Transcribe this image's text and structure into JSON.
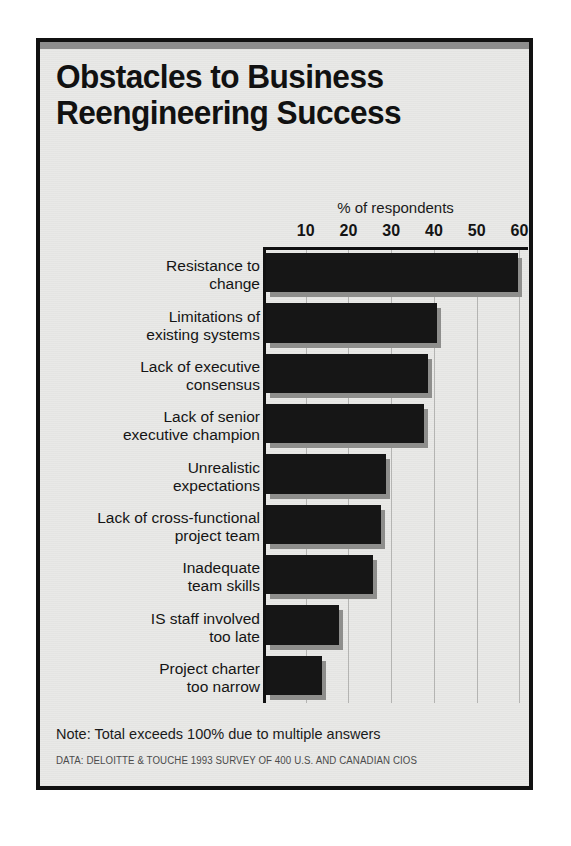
{
  "chart_data": {
    "type": "bar",
    "orientation": "horizontal",
    "title": "Obstacles to Business Reengineering Success",
    "title_lines": [
      "Obstacles to Business",
      "Reengineering Success"
    ],
    "xlabel": "% of respondents",
    "ylabel": "",
    "xlim": [
      0,
      62
    ],
    "xticks": [
      10,
      20,
      30,
      40,
      50,
      60
    ],
    "grid": true,
    "legend": false,
    "categories": [
      "Resistance to change",
      "Limitations of existing systems",
      "Lack of executive consensus",
      "Lack of senior executive champion",
      "Unrealistic expectations",
      "Lack of cross-functional project team",
      "Inadequate team skills",
      "IS staff involved too late",
      "Project charter too narrow"
    ],
    "category_lines": [
      [
        "Resistance to",
        "change"
      ],
      [
        "Limitations of",
        "existing systems"
      ],
      [
        "Lack of executive",
        "consensus"
      ],
      [
        "Lack of senior",
        "executive champion"
      ],
      [
        "Unrealistic",
        "expectations"
      ],
      [
        "Lack of cross-functional",
        "project team"
      ],
      [
        "Inadequate",
        "team skills"
      ],
      [
        "IS staff involved",
        "too late"
      ],
      [
        "Project charter",
        "too narrow"
      ]
    ],
    "values": [
      59,
      40,
      38,
      37,
      28,
      27,
      25,
      17,
      13
    ],
    "note": "Note: Total exceeds 100% due to multiple answers",
    "source": "DATA: DELOITTE & TOUCHE 1993 SURVEY OF 400 U.S. AND CANADIAN CIOS",
    "colors": {
      "bar": "#161616",
      "bar_shadow": "#8e8e8c",
      "background": "#e9e9e7",
      "frame": "#111111",
      "gridline": "#b4b4b2",
      "top_bar": "#8d8d8d"
    }
  }
}
